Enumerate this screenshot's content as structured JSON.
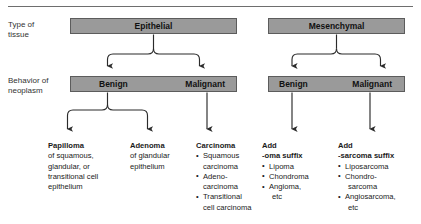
{
  "theme": {
    "box_fill": "#9a9a9a",
    "box_border": "#5c5c5c",
    "line": "#333333",
    "rule": "#6e6e6e",
    "text": "#1a1a1a",
    "background": "#ffffff"
  },
  "row_labels": {
    "tissue": {
      "line1": "Type of",
      "line2": "tissue"
    },
    "behavior": {
      "line1": "Behavior of",
      "line2": "neoplasm"
    }
  },
  "tissue_boxes": [
    {
      "label": "Epithelial"
    },
    {
      "label": "Mesenchymal"
    }
  ],
  "behavior_boxes": [
    {
      "benign": "Benign",
      "malignant": "Malignant"
    },
    {
      "benign": "Benign",
      "malignant": "Malignant"
    }
  ],
  "columns": [
    {
      "heading": "Papilloma",
      "lines": [
        "of squamous,",
        "glandular, or",
        "transitional cell",
        "epithelium"
      ],
      "bullets": []
    },
    {
      "heading": "Adenoma",
      "lines": [
        "of glandular",
        "epithelium"
      ],
      "bullets": []
    },
    {
      "heading": "Carcinoma",
      "lines": [],
      "bullets": [
        {
          "first": "Squamous",
          "cont": "carcinoma"
        },
        {
          "first": "Adeno-",
          "cont": "carcinoma"
        },
        {
          "first": "Transitional",
          "cont": "cell carcinoma"
        }
      ]
    },
    {
      "heading": "Add",
      "heading2": "-oma suffix",
      "lines": [],
      "bullets": [
        {
          "first": "Lipoma"
        },
        {
          "first": "Chondroma"
        },
        {
          "first": "Angioma,",
          "indent": "etc"
        }
      ]
    },
    {
      "heading": "Add",
      "heading2": "-sarcoma suffix",
      "lines": [],
      "bullets": [
        {
          "first": "Liposarcoma"
        },
        {
          "first": "Chondro-",
          "cont": "sarcoma"
        },
        {
          "first": "Angiosarcoma,",
          "indent": "etc"
        }
      ]
    }
  ]
}
